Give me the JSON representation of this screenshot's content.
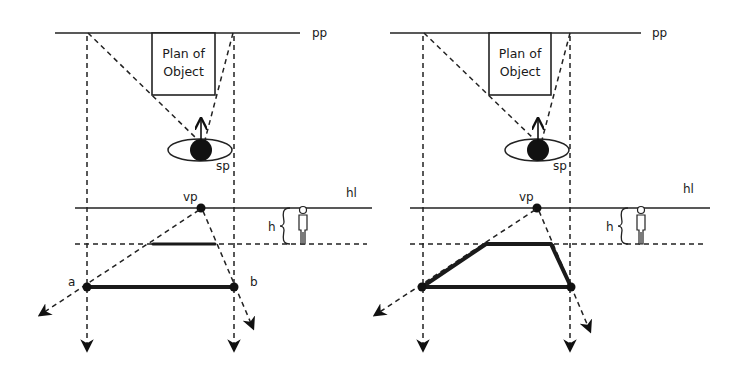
{
  "diagram": {
    "colors": {
      "ink": "#1a1a1a",
      "background": "#ffffff"
    },
    "panels": [
      {
        "id": "left",
        "labels": {
          "picture_plane": "pp",
          "plan_box_line1": "Plan of",
          "plan_box_line2": "Object",
          "station_point": "sp",
          "vanishing_point": "vp",
          "horizon_line": "hl",
          "height": "h",
          "point_a": "a",
          "point_b": "b"
        },
        "shape": "front edge only (line a–b) with receding edge segment at dashed ground line"
      },
      {
        "id": "right",
        "labels": {
          "picture_plane": "pp",
          "plan_box_line1": "Plan of",
          "plan_box_line2": "Object",
          "station_point": "sp",
          "vanishing_point": "vp",
          "horizon_line": "hl",
          "height": "h"
        },
        "shape": "completed trapezoid perspective of object plan"
      }
    ]
  }
}
